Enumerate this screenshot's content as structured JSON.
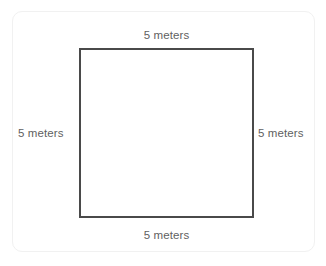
{
  "figure": {
    "shape": "square",
    "stroke_color": "#4a4a4a",
    "label_color": "#5f5f5f",
    "card_border_color": "#f1f1f1",
    "background_color": "#ffffff",
    "labels": {
      "top": "5 meters",
      "right": "5 meters",
      "bottom": "5 meters",
      "left": "5 meters"
    }
  }
}
